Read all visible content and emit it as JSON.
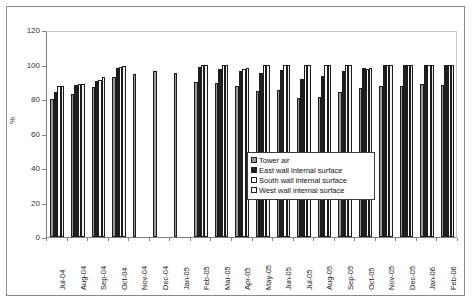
{
  "chart_data": {
    "type": "bar",
    "title": "",
    "xlabel": "",
    "ylabel": "%",
    "ylim": [
      0,
      120
    ],
    "yticks": [
      0,
      20,
      40,
      60,
      80,
      100,
      120
    ],
    "grid": false,
    "legend_position": "inside-center-right",
    "categories": [
      "Jul-04",
      "Aug-04",
      "Sep-04",
      "Oct-04",
      "Nov-04",
      "Dec-04",
      "Jan-05",
      "Feb-05",
      "Mar-05",
      "Apr-05",
      "May-05",
      "Jun-05",
      "Jul-05",
      "Aug-05",
      "Sep-05",
      "Oct-05",
      "Nov-05",
      "Dec-05",
      "Jan-06",
      "Feb-06"
    ],
    "series": [
      {
        "name": "Tower air",
        "values": [
          80,
          83,
          87,
          93,
          94.5,
          96.5,
          95,
          90,
          89,
          87.5,
          84.5,
          85.5,
          80.5,
          81,
          84,
          86.5,
          87.5,
          87.5,
          88.5,
          88
        ]
      },
      {
        "name": "East wall internal surface",
        "values": [
          84,
          88,
          90.5,
          98,
          null,
          null,
          null,
          98.5,
          97.5,
          96.5,
          95,
          97,
          91.5,
          93.5,
          96.5,
          98,
          100,
          100,
          100,
          100
        ]
      },
      {
        "name": "South wall internal surface",
        "values": [
          87.5,
          88.5,
          91,
          98.5,
          null,
          null,
          null,
          100,
          100,
          97.5,
          100,
          100,
          100,
          100,
          100,
          97.5,
          100,
          100,
          100,
          100
        ]
      },
      {
        "name": "West wall internal surface",
        "values": [
          87.5,
          88.5,
          92.5,
          99,
          null,
          null,
          null,
          100,
          100,
          98,
          100,
          100,
          100,
          100,
          100,
          98,
          100,
          100,
          100,
          100
        ]
      }
    ]
  },
  "legend": {
    "items": [
      {
        "label": "Tower air"
      },
      {
        "label": "East wall internal surface"
      },
      {
        "label": "South wall internal surface"
      },
      {
        "label": "West wall internal surface"
      }
    ]
  },
  "colors": {
    "series_0": "#9a9a9a",
    "series_1": "#1f1f1f",
    "series_2": "#ffffff",
    "series_3": "#f2f2f2",
    "axis": "#808080",
    "frame": "#8a8a8a",
    "text": "#222222",
    "background": "#ffffff"
  }
}
